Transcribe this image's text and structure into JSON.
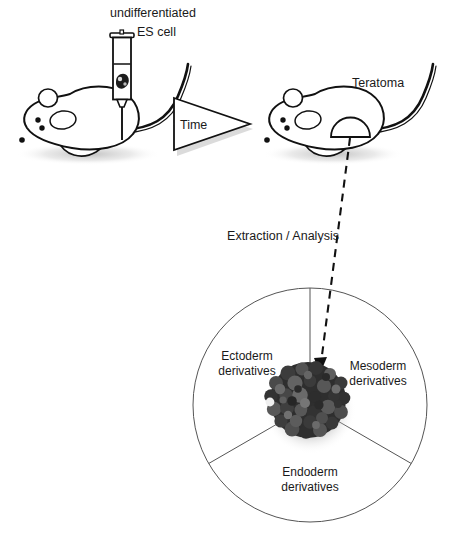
{
  "figure": {
    "title_visible": false,
    "background_color": "#ffffff",
    "ink_color": "#111111",
    "labels": {
      "injection_top": "undifferentiated",
      "injection_bottom": "ES cell",
      "time_arrow": "Time",
      "teratoma": "Teratoma",
      "extraction": "Extraction / Analysis",
      "sector_left_line1": "Ectoderm",
      "sector_left_line2": "derivatives",
      "sector_right_line1": "Mesoderm",
      "sector_right_line2": "derivatives",
      "sector_bottom_line1": "Endoderm",
      "sector_bottom_line2": "derivatives"
    },
    "icons": {
      "syringe": "syringe-icon",
      "mouse_left": "mouse-icon",
      "mouse_right": "mouse-with-tumor-icon",
      "time_triangle": "time-arrow-icon",
      "dashed_arrow": "dashed-arrow-icon",
      "cell_cluster": "cell-cluster-icon",
      "pie_circle": "three-sector-circle-icon"
    },
    "geometry": {
      "circle_center_x": 310,
      "circle_center_y": 405,
      "circle_radius": 117,
      "cluster_center_x": 308,
      "cluster_center_y": 400,
      "cluster_radius": 40
    },
    "colors": {
      "outline": "#111111",
      "sector_line": "#555555",
      "cell_dark": "#2b2b2b",
      "cell_mid": "#4a4a4a",
      "cell_light": "#6e6e6e",
      "shadow": "#c9c9c9"
    }
  }
}
